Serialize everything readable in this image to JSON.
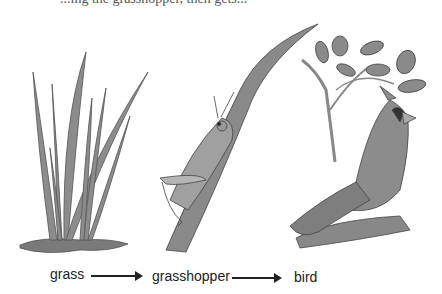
{
  "header": {
    "partial_text": "...ing the grasshopper, then gets..."
  },
  "food_chain": {
    "organisms": [
      {
        "id": "grass",
        "label": "grass"
      },
      {
        "id": "grasshopper",
        "label": "grasshopper"
      },
      {
        "id": "bird",
        "label": "bird"
      }
    ],
    "arrows": [
      {
        "from": "grass",
        "to": "grasshopper"
      },
      {
        "from": "grasshopper",
        "to": "bird"
      }
    ]
  },
  "colors": {
    "plant": "#8a8a8a",
    "outline": "#4a4a4a",
    "soil": "#7a7a7a"
  }
}
